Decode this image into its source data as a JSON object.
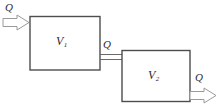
{
  "diagram": {
    "type": "process-flow-diagram",
    "colors": {
      "background": "#ffffff",
      "stroke": "#4d4d4d",
      "arrow_stroke": "#8c8c8c",
      "text": "#2b2b2b"
    },
    "vessels": [
      {
        "id": "v1",
        "symbol": "V",
        "subscript": "1",
        "name": "vessel-v1"
      },
      {
        "id": "v2",
        "symbol": "V",
        "subscript": "2",
        "name": "vessel-v2"
      }
    ],
    "flows": [
      {
        "id": "q-in",
        "label": "Q",
        "name": "inlet-flow-v1",
        "direction": "right"
      },
      {
        "id": "q-mid",
        "label": "Q",
        "name": "interconnect-flow",
        "direction": "right"
      },
      {
        "id": "q-out",
        "label": "Q",
        "name": "outlet-flow-v2",
        "direction": "right"
      }
    ]
  }
}
